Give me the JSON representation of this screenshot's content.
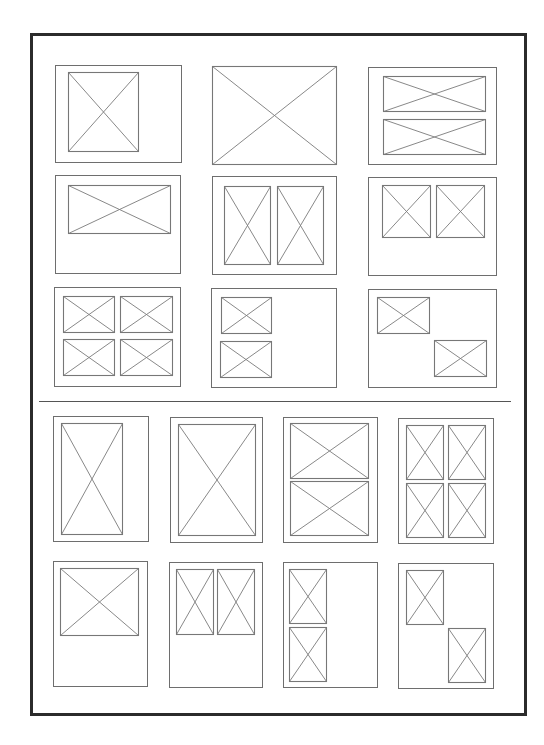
{
  "colors": {
    "frame": "#2b2b2b",
    "cell_border": "#6e6e6e",
    "placeholder_line": "#7a7a7a",
    "divider": "#555555",
    "background": "#ffffff"
  },
  "frame": {
    "x": 30,
    "y": 33,
    "w": 497,
    "h": 683
  },
  "divider": {
    "x": 39,
    "y": 401,
    "w": 472
  },
  "sections": [
    {
      "name": "landscape-layouts",
      "cells": [
        {
          "id": "L1",
          "x": 55,
          "y": 65,
          "w": 127,
          "h": 98,
          "placeholders": [
            {
              "x": 68,
              "y": 72,
              "w": 71,
              "h": 80
            }
          ]
        },
        {
          "id": "L2",
          "x": 212,
          "y": 66,
          "w": 125,
          "h": 99,
          "placeholders": [
            {
              "x": 212,
              "y": 66,
              "w": 125,
              "h": 99
            }
          ]
        },
        {
          "id": "L3",
          "x": 368,
          "y": 67,
          "w": 129,
          "h": 98,
          "placeholders": [
            {
              "x": 383,
              "y": 76,
              "w": 103,
              "h": 36
            },
            {
              "x": 383,
              "y": 119,
              "w": 103,
              "h": 36
            }
          ]
        },
        {
          "id": "L4",
          "x": 55,
          "y": 175,
          "w": 126,
          "h": 99,
          "placeholders": [
            {
              "x": 68,
              "y": 185,
              "w": 103,
              "h": 49
            }
          ]
        },
        {
          "id": "L5",
          "x": 212,
          "y": 176,
          "w": 125,
          "h": 99,
          "placeholders": [
            {
              "x": 224,
              "y": 186,
              "w": 47,
              "h": 79
            },
            {
              "x": 277,
              "y": 186,
              "w": 47,
              "h": 79
            }
          ]
        },
        {
          "id": "L6",
          "x": 368,
          "y": 177,
          "w": 129,
          "h": 99,
          "placeholders": [
            {
              "x": 382,
              "y": 185,
              "w": 49,
              "h": 53
            },
            {
              "x": 436,
              "y": 185,
              "w": 49,
              "h": 53
            }
          ]
        },
        {
          "id": "L7",
          "x": 54,
          "y": 287,
          "w": 127,
          "h": 100,
          "placeholders": [
            {
              "x": 63,
              "y": 296,
              "w": 52,
              "h": 37
            },
            {
              "x": 120,
              "y": 296,
              "w": 53,
              "h": 37
            },
            {
              "x": 63,
              "y": 339,
              "w": 52,
              "h": 37
            },
            {
              "x": 120,
              "y": 339,
              "w": 53,
              "h": 37
            }
          ]
        },
        {
          "id": "L8",
          "x": 211,
          "y": 288,
          "w": 126,
          "h": 100,
          "placeholders": [
            {
              "x": 221,
              "y": 297,
              "w": 51,
              "h": 37
            },
            {
              "x": 220,
              "y": 341,
              "w": 52,
              "h": 37
            }
          ]
        },
        {
          "id": "L9",
          "x": 368,
          "y": 289,
          "w": 129,
          "h": 99,
          "placeholders": [
            {
              "x": 377,
              "y": 297,
              "w": 53,
              "h": 37
            },
            {
              "x": 434,
              "y": 340,
              "w": 53,
              "h": 37
            }
          ]
        }
      ]
    },
    {
      "name": "portrait-layouts",
      "cells": [
        {
          "id": "P1",
          "x": 53,
          "y": 416,
          "w": 96,
          "h": 126,
          "placeholders": [
            {
              "x": 61,
              "y": 423,
              "w": 62,
              "h": 112
            }
          ]
        },
        {
          "id": "P2",
          "x": 170,
          "y": 417,
          "w": 93,
          "h": 126,
          "placeholders": [
            {
              "x": 178,
              "y": 424,
              "w": 78,
              "h": 112
            }
          ]
        },
        {
          "id": "P3",
          "x": 283,
          "y": 417,
          "w": 95,
          "h": 126,
          "placeholders": [
            {
              "x": 290,
              "y": 423,
              "w": 79,
              "h": 56
            },
            {
              "x": 290,
              "y": 481,
              "w": 79,
              "h": 55
            }
          ]
        },
        {
          "id": "P4",
          "x": 398,
          "y": 418,
          "w": 96,
          "h": 126,
          "placeholders": [
            {
              "x": 406,
              "y": 425,
              "w": 38,
              "h": 55
            },
            {
              "x": 448,
              "y": 425,
              "w": 38,
              "h": 55
            },
            {
              "x": 406,
              "y": 483,
              "w": 38,
              "h": 55
            },
            {
              "x": 448,
              "y": 483,
              "w": 38,
              "h": 55
            }
          ]
        },
        {
          "id": "P5",
          "x": 53,
          "y": 561,
          "w": 95,
          "h": 126,
          "placeholders": [
            {
              "x": 60,
              "y": 568,
              "w": 79,
              "h": 68
            }
          ]
        },
        {
          "id": "P6",
          "x": 169,
          "y": 562,
          "w": 94,
          "h": 126,
          "placeholders": [
            {
              "x": 176,
              "y": 569,
              "w": 38,
              "h": 66
            },
            {
              "x": 217,
              "y": 569,
              "w": 38,
              "h": 66
            }
          ]
        },
        {
          "id": "P7",
          "x": 283,
          "y": 562,
          "w": 95,
          "h": 126,
          "placeholders": [
            {
              "x": 289,
              "y": 569,
              "w": 38,
              "h": 55
            },
            {
              "x": 289,
              "y": 627,
              "w": 38,
              "h": 55
            }
          ]
        },
        {
          "id": "P8",
          "x": 398,
          "y": 563,
          "w": 96,
          "h": 126,
          "placeholders": [
            {
              "x": 406,
              "y": 570,
              "w": 38,
              "h": 55
            },
            {
              "x": 448,
              "y": 628,
              "w": 38,
              "h": 55
            }
          ]
        }
      ]
    }
  ]
}
